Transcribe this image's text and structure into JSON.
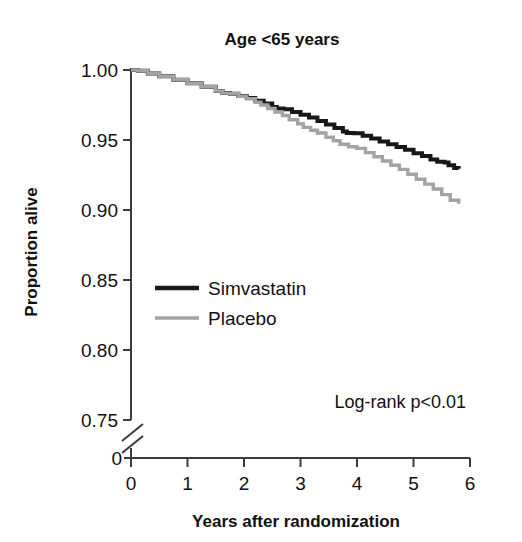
{
  "chart_data": {
    "type": "line",
    "title": "Age <65 years",
    "xlabel": "Years after randomization",
    "ylabel": "Proportion alive",
    "xlim": [
      0,
      6
    ],
    "ylim": [
      0.75,
      1.0
    ],
    "grid": false,
    "axis_break": true,
    "axis_break_label": "0",
    "xticks": [
      "0",
      "1",
      "2",
      "3",
      "4",
      "5",
      "6"
    ],
    "xtick_values": [
      0,
      1,
      2,
      3,
      4,
      5,
      6
    ],
    "yticks": [
      "1.00",
      "0.95",
      "0.90",
      "0.85",
      "0.80",
      "0.75"
    ],
    "ytick_values": [
      1.0,
      0.95,
      0.9,
      0.85,
      0.8,
      0.75
    ],
    "legend_position": "center-left",
    "annotations": [
      {
        "text": "Log-rank p<0.01",
        "x": 5.75,
        "y": 0.762
      }
    ],
    "series": [
      {
        "name": "Simvastatin",
        "color": "#171717",
        "linewidth": 4,
        "x": [
          0.0,
          0.12,
          0.3,
          0.5,
          0.75,
          1.0,
          1.25,
          1.5,
          1.62,
          1.75,
          1.9,
          2.05,
          2.2,
          2.35,
          2.5,
          2.58,
          2.7,
          2.85,
          3.0,
          3.15,
          3.3,
          3.45,
          3.6,
          3.75,
          3.82,
          3.95,
          4.1,
          4.25,
          4.4,
          4.55,
          4.7,
          4.85,
          5.0,
          5.15,
          5.3,
          5.42,
          5.55,
          5.62,
          5.72,
          5.8
        ],
        "y": [
          1.0,
          0.9995,
          0.9975,
          0.9955,
          0.993,
          0.9905,
          0.988,
          0.985,
          0.9835,
          0.983,
          0.9815,
          0.98,
          0.978,
          0.976,
          0.9735,
          0.9725,
          0.972,
          0.97,
          0.968,
          0.966,
          0.9635,
          0.961,
          0.9585,
          0.956,
          0.955,
          0.9548,
          0.953,
          0.951,
          0.949,
          0.947,
          0.945,
          0.943,
          0.9405,
          0.9385,
          0.936,
          0.9345,
          0.934,
          0.932,
          0.93,
          0.9295
        ]
      },
      {
        "name": "Placebo",
        "color": "#a3a3a3",
        "linewidth": 3.4,
        "x": [
          0.0,
          0.12,
          0.3,
          0.5,
          0.75,
          1.0,
          1.25,
          1.5,
          1.62,
          1.75,
          1.9,
          2.05,
          2.2,
          2.3,
          2.42,
          2.55,
          2.68,
          2.8,
          2.95,
          3.05,
          3.18,
          3.3,
          3.45,
          3.58,
          3.7,
          3.85,
          4.0,
          4.15,
          4.3,
          4.45,
          4.6,
          4.75,
          4.9,
          5.05,
          5.2,
          5.35,
          5.5,
          5.65,
          5.8
        ],
        "y": [
          1.0,
          0.9995,
          0.9975,
          0.9955,
          0.993,
          0.9905,
          0.988,
          0.985,
          0.9835,
          0.983,
          0.9812,
          0.9795,
          0.977,
          0.975,
          0.9725,
          0.97,
          0.9675,
          0.9645,
          0.9615,
          0.959,
          0.957,
          0.955,
          0.952,
          0.9495,
          0.947,
          0.9452,
          0.944,
          0.941,
          0.938,
          0.935,
          0.932,
          0.929,
          0.9255,
          0.922,
          0.9185,
          0.915,
          0.911,
          0.907,
          0.9045
        ]
      }
    ]
  },
  "legend": {
    "items": [
      {
        "label": "Simvastatin"
      },
      {
        "label": "Placebo"
      }
    ]
  }
}
